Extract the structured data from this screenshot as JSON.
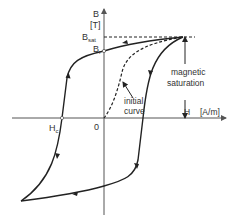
{
  "diagram": {
    "axes": {
      "y_label": "B",
      "y_unit": "[T]",
      "x_label": "H",
      "x_unit": "[A/m]",
      "origin_label": "0"
    },
    "labels": {
      "b_sat": "B",
      "b_sat_sub": "sat",
      "b_r": "B",
      "b_r_sub": "r",
      "h_c": "H",
      "h_c_sub": "c",
      "annotation_saturation_line1": "magnetic",
      "annotation_saturation_line2": "saturation",
      "annotation_initial_line1": "initial",
      "annotation_initial_line2": "curve"
    },
    "colors": {
      "curve": "#222222",
      "axis": "#555555",
      "text": "#333333",
      "background": "#ffffff"
    }
  }
}
